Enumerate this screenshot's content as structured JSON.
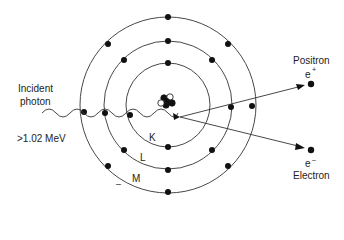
{
  "diagram": {
    "incident": {
      "label_line1": "Incident",
      "label_line2": "photon",
      "energy": ">1.02 MeV"
    },
    "shells": [
      {
        "name": "K",
        "radius": 42
      },
      {
        "name": "L",
        "radius": 64
      },
      {
        "name": "M",
        "radius": 88
      }
    ],
    "products": {
      "positron": {
        "label": "Positron",
        "symbol": "e",
        "charge": "+"
      },
      "electron": {
        "label": "Electron",
        "symbol": "e",
        "charge": "–"
      }
    },
    "stray_mark": "–",
    "colors": {
      "line": "#333333",
      "dot": "#111111",
      "background": "#ffffff"
    }
  }
}
